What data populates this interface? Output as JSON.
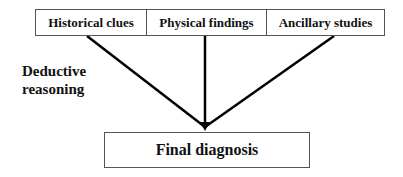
{
  "diagram": {
    "inputs": [
      {
        "label": "Historical clues"
      },
      {
        "label": "Physical findings"
      },
      {
        "label": "Ancillary studies"
      }
    ],
    "process_label": {
      "line1": "Deductive",
      "line2": "reasoning"
    },
    "output": {
      "label": "Final diagnosis"
    },
    "colors": {
      "lines": "#000000",
      "box_border": "#555555",
      "text": "#111111"
    }
  }
}
